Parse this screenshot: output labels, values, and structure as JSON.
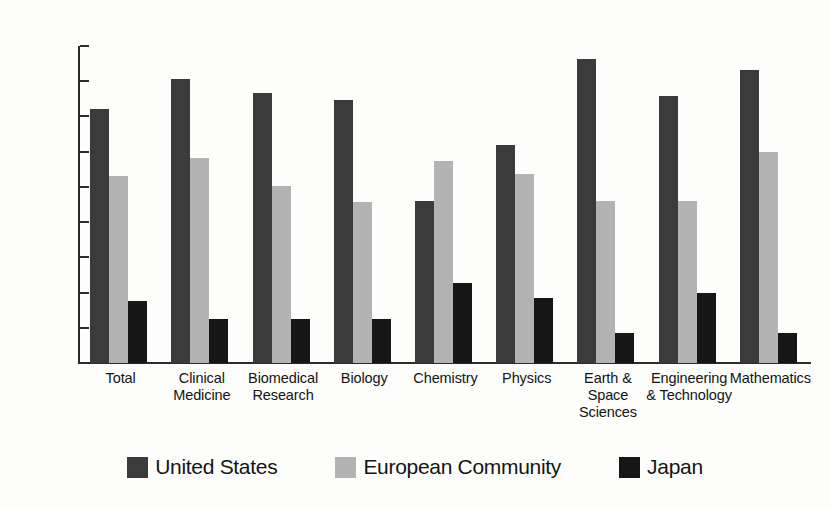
{
  "chart_data": {
    "type": "bar",
    "title": "",
    "xlabel": "",
    "ylabel": "",
    "ylim": [
      0,
      45
    ],
    "ytick_values": [
      0,
      5,
      10,
      15,
      20,
      25,
      30,
      35,
      40,
      45
    ],
    "ytick_labels": [
      "0%",
      "5%",
      "10%",
      "15%",
      "20%",
      "25%",
      "30%",
      "35%",
      "40%",
      "45%"
    ],
    "grid": false,
    "legend_position": "bottom",
    "categories": [
      "Total",
      "Clinical Medicine",
      "Biomedical Research",
      "Biology",
      "Chemistry",
      "Physics",
      "Earth & Space Sciences",
      "Engineering & Technology",
      "Mathematics"
    ],
    "category_label_lines": [
      [
        "Total"
      ],
      [
        "Clinical",
        "Medicine"
      ],
      [
        "Biomedical",
        "Research"
      ],
      [
        "Biology"
      ],
      [
        "Chemistry"
      ],
      [
        "Physics"
      ],
      [
        "Earth &",
        "Space",
        "Sciences"
      ],
      [
        "Engineering",
        "& Technology"
      ],
      [
        "Mathematics"
      ]
    ],
    "series": [
      {
        "name": "United States",
        "color": "#3b3b3b",
        "values": [
          36.0,
          40.3,
          38.3,
          37.4,
          23.0,
          31.0,
          43.2,
          37.9,
          41.6
        ]
      },
      {
        "name": "European Community",
        "color": "#b3b3b3",
        "values": [
          26.6,
          29.1,
          25.1,
          22.8,
          28.7,
          26.9,
          23.0,
          23.0,
          29.9
        ]
      },
      {
        "name": "Japan",
        "color": "#161616",
        "values": [
          8.8,
          6.2,
          6.3,
          6.2,
          11.4,
          9.3,
          4.2,
          10.0,
          4.3
        ]
      }
    ]
  },
  "legend": {
    "items": [
      {
        "label": "United States",
        "swatch": "us"
      },
      {
        "label": "European  Community",
        "swatch": "ec"
      },
      {
        "label": "Japan",
        "swatch": "jp"
      }
    ]
  }
}
